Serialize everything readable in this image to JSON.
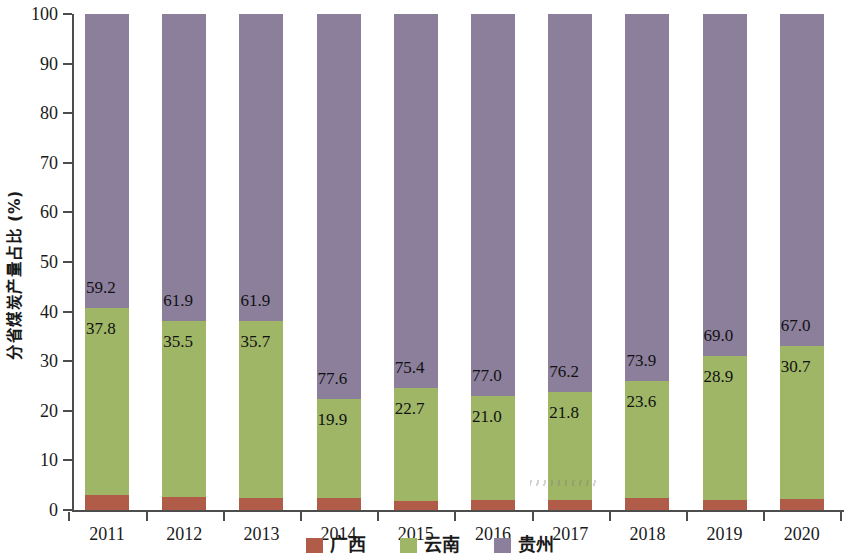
{
  "chart_data": {
    "type": "bar",
    "subtype": "stacked-bar-100",
    "title": "",
    "xlabel": "年份",
    "ylabel": "分省煤炭产量占比 (%)",
    "categories": [
      "2011",
      "2012",
      "2013",
      "2014",
      "2015",
      "2016",
      "2017",
      "2018",
      "2019",
      "2020"
    ],
    "series": [
      {
        "name": "广西",
        "color": "#b15c48",
        "values": [
          3.0,
          2.6,
          2.4,
          2.5,
          1.9,
          2.0,
          2.0,
          2.5,
          2.1,
          2.3
        ],
        "labels_shown": false
      },
      {
        "name": "云南",
        "color": "#9fb667",
        "values": [
          37.8,
          35.5,
          35.7,
          19.9,
          22.7,
          21.0,
          21.8,
          23.6,
          28.9,
          30.7
        ],
        "labels_shown": true,
        "labels": [
          "37.8",
          "35.5",
          "35.7",
          "19.9",
          "22.7",
          "21.0",
          "21.8",
          "23.6",
          "28.9",
          "30.7"
        ]
      },
      {
        "name": "贵州",
        "color": "#8b7f9c",
        "values": [
          59.2,
          61.9,
          61.9,
          77.6,
          75.4,
          77.0,
          76.2,
          73.9,
          69.0,
          67.0
        ],
        "labels_shown": true,
        "labels": [
          "59.2",
          "61.9",
          "61.9",
          "77.6",
          "75.4",
          "77.0",
          "76.2",
          "73.9",
          "69.0",
          "67.0"
        ]
      }
    ],
    "ylim": [
      0,
      100
    ],
    "yticks": [
      "0",
      "10",
      "20",
      "30",
      "40",
      "50",
      "60",
      "70",
      "80",
      "90",
      "100"
    ],
    "ytick_values": [
      0,
      10,
      20,
      30,
      40,
      50,
      60,
      70,
      80,
      90,
      100
    ],
    "grid": false,
    "legend_position": "bottom-center",
    "legend": [
      "广西",
      "云南",
      "贵州"
    ]
  },
  "axis": {
    "y_title": "分省煤炭产量占比 (%)",
    "x_title": "年份"
  }
}
